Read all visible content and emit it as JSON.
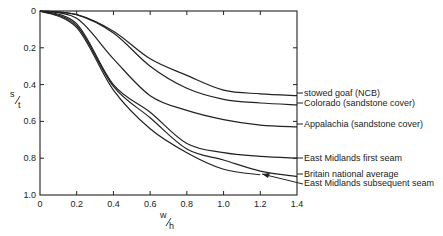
{
  "chart_data": {
    "type": "line",
    "title": "",
    "xlabel": "w/h",
    "ylabel": "s/t",
    "xlim": [
      0,
      1.4
    ],
    "ylim": [
      0,
      1.0
    ],
    "y_inverted": true,
    "grid": false,
    "legend_position": "right-inline-labels",
    "x_ticks": [
      "0",
      "0.2",
      "0.4",
      "0.6",
      "0.8",
      "1.0",
      "1.2",
      "1.4"
    ],
    "y_ticks": [
      "0",
      "0.2",
      "0.4",
      "0.6",
      "0.8",
      "1.0"
    ],
    "x": [
      0,
      0.2,
      0.4,
      0.6,
      0.8,
      1.0,
      1.2,
      1.4
    ],
    "series": [
      {
        "name": "stowed goaf (NCB)",
        "values": [
          0,
          0.02,
          0.11,
          0.26,
          0.35,
          0.43,
          0.45,
          0.46
        ]
      },
      {
        "name": "Colorado (sandstone cover)",
        "values": [
          0,
          0.02,
          0.12,
          0.3,
          0.42,
          0.48,
          0.5,
          0.51
        ]
      },
      {
        "name": "Appalachia (sandstone cover)",
        "values": [
          0,
          0.04,
          0.26,
          0.46,
          0.54,
          0.59,
          0.62,
          0.63
        ]
      },
      {
        "name": "East Midlands first seam",
        "values": [
          0,
          0.07,
          0.4,
          0.55,
          0.72,
          0.77,
          0.79,
          0.8
        ]
      },
      {
        "name": "Britain national average",
        "values": [
          0,
          0.08,
          0.41,
          0.58,
          0.75,
          0.81,
          0.87,
          0.9
        ]
      },
      {
        "name": "East Midlands subsequent seam",
        "values": [
          0,
          0.09,
          0.43,
          0.64,
          0.77,
          0.86,
          0.89,
          0.9
        ]
      }
    ],
    "annotations": [
      {
        "text": "arrow from 'East Midlands subsequent seam' label to its curve near w/h≈1.25"
      }
    ]
  },
  "labels": {
    "ylabel_num": "s",
    "ylabel_den": "t",
    "xlabel_num": "w",
    "xlabel_den": "h"
  }
}
